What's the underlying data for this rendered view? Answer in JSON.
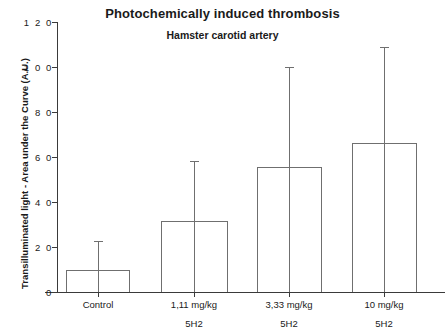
{
  "chart_data": {
    "type": "bar",
    "title": "Photochemically induced thrombosis",
    "subtitle": "Hamster carotid artery",
    "xlabel": "",
    "ylabel": "Transilluminated light - Area under the Curve (A.U.)",
    "ylim": [
      0,
      12
    ],
    "ytick_labels": [
      "1 2 0",
      "1 0 0",
      "8 0",
      "6 0",
      "4 0",
      "2 0",
      "0"
    ],
    "ytick_values": [
      12.0,
      10.0,
      8.0,
      6.0,
      4.0,
      2.0,
      0
    ],
    "grid": false,
    "legend": "none",
    "categories": [
      "Control",
      "1,11 mg/kg",
      "3,33 mg/kg",
      "10 mg/kg"
    ],
    "category_sublabels": [
      "",
      "5H2",
      "5H2",
      "5H2"
    ],
    "values": [
      1.0,
      3.15,
      5.55,
      6.65
    ],
    "error_high": [
      2.3,
      5.8,
      10.0,
      10.85
    ],
    "series": [
      {
        "name": "Transilluminated light AUC",
        "values": [
          1.0,
          3.15,
          5.55,
          6.65
        ],
        "error_high": [
          2.3,
          5.8,
          10.0,
          10.85
        ]
      }
    ]
  },
  "figure": {
    "title": "Photochemically induced thrombosis",
    "subtitle": "Hamster carotid artery",
    "ylabel": "Transilluminated light - Area under the Curve (A.U.)",
    "yticks": [
      {
        "label": "1 2 0",
        "y": 22
      },
      {
        "label": "1 0 0",
        "y": 67
      },
      {
        "label": "8 0",
        "y": 112
      },
      {
        "label": "6 0",
        "y": 157
      },
      {
        "label": "4 0",
        "y": 202
      },
      {
        "label": "2 0",
        "y": 247
      },
      {
        "label": "0",
        "y": 292
      }
    ],
    "bars": [
      {
        "label": "Control",
        "sub": "",
        "left": 66,
        "width": 64,
        "top": 270,
        "err_top": 241,
        "center": 98
      },
      {
        "label": "1,11 mg/kg",
        "sub": "5H2",
        "left": 161,
        "width": 67,
        "top": 221,
        "err_top": 161,
        "center": 194
      },
      {
        "label": "3,33 mg/kg",
        "sub": "5H2",
        "left": 257,
        "width": 65,
        "top": 167,
        "err_top": 67,
        "center": 289
      },
      {
        "label": "10 mg/kg",
        "sub": "5H2",
        "left": 352,
        "width": 65,
        "top": 143,
        "err_top": 47,
        "center": 384
      }
    ]
  }
}
